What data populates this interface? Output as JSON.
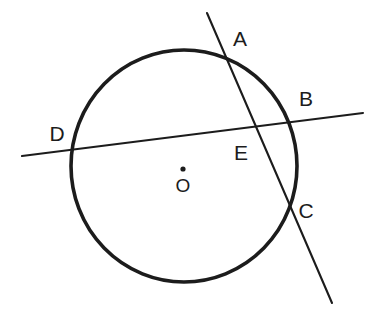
{
  "figure": {
    "kind": "circle-geometry-diagram",
    "background_color": "#ffffff",
    "stroke_color": "#1c1c1c",
    "canvas": {
      "width": 376,
      "height": 317
    }
  },
  "circle": {
    "name": "circle-O",
    "center_x": 184,
    "center_y": 166,
    "radius_x": 113,
    "radius_y": 116,
    "stroke_width": 3.6,
    "stroke_color": "#1c1c1c",
    "fill": "none"
  },
  "center_point": {
    "name": "center-dot",
    "x": 183,
    "y": 169,
    "radius": 2.6,
    "fill_color": "#1c1c1c"
  },
  "lines": [
    {
      "name": "secant-line-AC",
      "label": "AC",
      "x1": 207,
      "y1": 13,
      "x2": 332,
      "y2": 303,
      "stroke_width": 2.1,
      "stroke_color": "#1c1c1c"
    },
    {
      "name": "secant-line-DB",
      "label": "DB",
      "x1": 22,
      "y1": 156,
      "x2": 363,
      "y2": 113,
      "stroke_width": 2.1,
      "stroke_color": "#1c1c1c"
    }
  ],
  "labels": {
    "a": {
      "text": "A",
      "x": 240,
      "y": 40
    },
    "b": {
      "text": "B",
      "x": 306,
      "y": 100
    },
    "c": {
      "text": "C",
      "x": 306,
      "y": 212
    },
    "d": {
      "text": "D",
      "x": 57,
      "y": 135
    },
    "e": {
      "text": "E",
      "x": 241,
      "y": 154
    },
    "o": {
      "text": "O",
      "x": 183,
      "y": 187
    }
  },
  "points": {
    "A": {
      "x": 209,
      "y": 62,
      "note": "upper intersection of line AC with circle"
    },
    "B": {
      "x": 291,
      "y": 122,
      "note": "right intersection of line DB with circle"
    },
    "C": {
      "x": 290,
      "y": 208,
      "note": "lower intersection of line AC with circle"
    },
    "D": {
      "x": 71,
      "y": 153,
      "note": "left intersection of line DB with circle"
    },
    "E": {
      "x": 255,
      "y": 129,
      "note": "intersection of line AC and line DB inside circle"
    },
    "O": {
      "x": 183,
      "y": 169,
      "note": "center of circle"
    }
  }
}
